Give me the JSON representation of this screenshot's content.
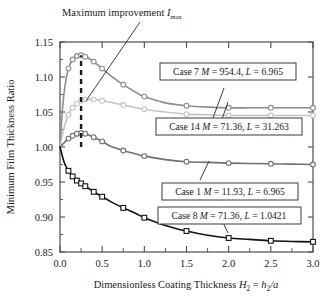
{
  "chart_data": {
    "type": "line",
    "title": "",
    "xlabel": "Dimensionless Coating Thickness H2 = h2/a",
    "ylabel": "Minimum Film Thickness Ratio",
    "xlim": [
      0.0,
      3.0
    ],
    "ylim": [
      0.85,
      1.15
    ],
    "xticks": [
      "0.0",
      "0.5",
      "1.0",
      "1.5",
      "2.0",
      "2.5",
      "3.0"
    ],
    "xtick_values": [
      0.0,
      0.5,
      1.0,
      1.5,
      2.0,
      2.5,
      3.0
    ],
    "yticks": [
      "0.85",
      "0.90",
      "0.95",
      "1.00",
      "1.05",
      "1.10",
      "1.15"
    ],
    "ytick_values": [
      0.85,
      0.9,
      0.95,
      1.0,
      1.05,
      1.1,
      1.15
    ],
    "grid": false,
    "legend_position": "inline-boxed-annotations",
    "minor_ticks_x": true,
    "series": [
      {
        "name": "Case 7",
        "label": "Case 7 M = 954.4, L = 6.965",
        "color": "#8c8c8c",
        "marker": "circle-open",
        "x": [
          0.0,
          0.03,
          0.06,
          0.1,
          0.15,
          0.2,
          0.25,
          0.3,
          0.35,
          0.4,
          0.5,
          0.6,
          0.75,
          0.9,
          1.0,
          1.25,
          1.5,
          1.75,
          2.0,
          2.25,
          2.5,
          2.75,
          3.0
        ],
        "y": [
          1.0,
          1.055,
          1.088,
          1.112,
          1.125,
          1.13,
          1.131,
          1.129,
          1.126,
          1.122,
          1.112,
          1.102,
          1.089,
          1.078,
          1.072,
          1.063,
          1.059,
          1.057,
          1.056,
          1.056,
          1.056,
          1.056,
          1.056
        ]
      },
      {
        "name": "Case 14",
        "label": "Case 14 M = 71.36, L = 31.263",
        "color": "#c4c4c4",
        "marker": "circle-open",
        "x": [
          0.0,
          0.03,
          0.06,
          0.1,
          0.15,
          0.2,
          0.25,
          0.3,
          0.35,
          0.4,
          0.5,
          0.6,
          0.75,
          0.9,
          1.0,
          1.25,
          1.5,
          1.75,
          2.0,
          2.25,
          2.5,
          2.75,
          3.0
        ],
        "y": [
          1.0,
          1.018,
          1.033,
          1.046,
          1.056,
          1.062,
          1.066,
          1.068,
          1.068,
          1.068,
          1.066,
          1.064,
          1.06,
          1.056,
          1.054,
          1.05,
          1.047,
          1.046,
          1.045,
          1.045,
          1.045,
          1.045,
          1.045
        ]
      },
      {
        "name": "Case 1",
        "label": "Case 1 M = 11.93, L = 6.965",
        "color": "#707070",
        "marker": "circle-open",
        "x": [
          0.0,
          0.05,
          0.1,
          0.15,
          0.2,
          0.25,
          0.3,
          0.4,
          0.5,
          0.6,
          0.75,
          0.9,
          1.0,
          1.25,
          1.5,
          1.75,
          2.0,
          2.25,
          2.5,
          2.75,
          3.0
        ],
        "y": [
          1.0,
          1.006,
          1.012,
          1.016,
          1.019,
          1.02,
          1.019,
          1.014,
          1.008,
          1.001,
          0.995,
          0.99,
          0.987,
          0.982,
          0.979,
          0.978,
          0.977,
          0.9765,
          0.976,
          0.9755,
          0.975
        ]
      },
      {
        "name": "Case 8",
        "label": "Case 8 M = 71.36, L = 1.0421",
        "color": "#111111",
        "marker": "square-open",
        "x": [
          0.0,
          0.05,
          0.1,
          0.15,
          0.2,
          0.25,
          0.3,
          0.35,
          0.4,
          0.5,
          0.6,
          0.75,
          0.9,
          1.0,
          1.25,
          1.5,
          1.75,
          2.0,
          2.25,
          2.5,
          2.75,
          3.0
        ],
        "y": [
          1.0,
          0.978,
          0.966,
          0.958,
          0.952,
          0.948,
          0.944,
          0.94,
          0.936,
          0.929,
          0.922,
          0.913,
          0.905,
          0.899,
          0.888,
          0.88,
          0.874,
          0.87,
          0.868,
          0.866,
          0.865,
          0.8645
        ]
      }
    ],
    "annotations": [
      {
        "name": "maximum-improvement",
        "text": "Maximum improvement I",
        "subscript": "max",
        "target_x": 0.25,
        "target_y": 1.083
      },
      {
        "name": "imax-dashed-line",
        "type": "vline-dashed",
        "x": 0.25,
        "y_from": 1.0,
        "y_to": 1.131
      }
    ]
  },
  "labels": {
    "case7": {
      "case": "Case 7",
      "m_sym": "M",
      "m_val": " = 954.4,",
      "l_sym": "L",
      "l_val": " = 6.965"
    },
    "case14": {
      "case": "Case 14",
      "m_sym": "M",
      "m_val": " = 71.36,",
      "l_sym": "L",
      "l_val": " = 31.263"
    },
    "case1": {
      "case": "Case 1",
      "m_sym": "M",
      "m_val": " = 11.93,",
      "l_sym": "L",
      "l_val": " = 6.965"
    },
    "case8": {
      "case": "Case 8",
      "m_sym": "M",
      "m_val": " = 71.36,",
      "l_sym": "L",
      "l_val": " = 1.0421"
    }
  },
  "annotation": {
    "text": "Maximum improvement ",
    "symbol": "I",
    "sub": "max"
  },
  "axes": {
    "ylabel": "Minimum Film Thickness Ratio",
    "xlabel_pre": "Dimensionless Coating Thickness ",
    "xlabel_h": "H",
    "xlabel_h_sub": "2",
    "xlabel_eq": " = ",
    "xlabel_h2": "h",
    "xlabel_h2_sub": "2",
    "xlabel_a": "/a",
    "xticks": [
      "0.0",
      "0.5",
      "1.0",
      "1.5",
      "2.0",
      "2.5",
      "3.0"
    ],
    "yticks": [
      "1.15",
      "1.10",
      "1.05",
      "1.00",
      "0.95",
      "0.90",
      "0.85"
    ]
  },
  "colors": {
    "case7": "#8c8c8c",
    "case14": "#c4c4c4",
    "case1": "#707070",
    "case8": "#111111",
    "frame": "#4d4d4d",
    "background": "#ffffff"
  }
}
